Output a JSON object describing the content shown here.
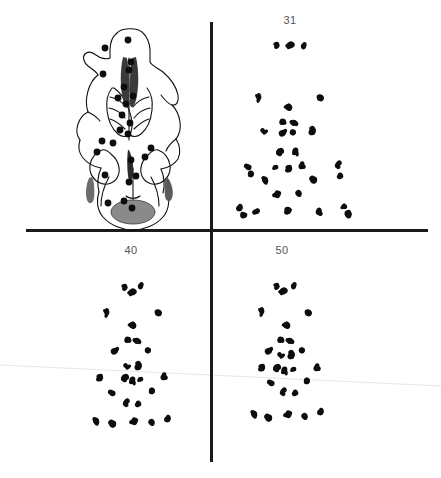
{
  "figure": {
    "title": "",
    "background_color": "#ffffff",
    "width": 441,
    "height": 478,
    "ink_color": "#111111",
    "label_color": "#555555",
    "divider_color": "#1a1a1a",
    "artifact_color": "#e2e2e2"
  },
  "layout": {
    "divider_vertical": {
      "x": 211,
      "y_start": 22,
      "y_end": 462,
      "thickness": 3
    },
    "divider_horizontal": {
      "y": 230,
      "x_start": 26,
      "x_end": 428,
      "thickness": 3
    },
    "artifact_scan_line": {
      "x1": 0,
      "y1": 365,
      "x2": 441,
      "y2": 386
    }
  },
  "panels": [
    {
      "id": "skull-drawing",
      "name": "skull-ventral-view",
      "label": "",
      "label_x": 0,
      "label_y": 0,
      "kind": "line-drawing"
    },
    {
      "id": "panel-31",
      "name": "landmark-scatter-31",
      "label": "31",
      "label_x": 290,
      "label_y": 17,
      "kind": "scatter"
    },
    {
      "id": "panel-40",
      "name": "landmark-scatter-40",
      "label": "40",
      "label_x": 131,
      "label_y": 247,
      "kind": "scatter"
    },
    {
      "id": "panel-50",
      "name": "landmark-scatter-50",
      "label": "50",
      "label_x": 282,
      "label_y": 247,
      "kind": "scatter"
    }
  ],
  "chart_data": {
    "type": "scatter",
    "title": "",
    "subtitle": "",
    "xlabel": "",
    "ylabel": "",
    "grid": false,
    "legend": "none",
    "panels": [
      {
        "name": "skull-ventral-view",
        "label": "",
        "type": "line-drawing-with-landmarks",
        "landmarks": [
          [
            128,
            40
          ],
          [
            105,
            48
          ],
          [
            103,
            74
          ],
          [
            131,
            62
          ],
          [
            124,
            87
          ],
          [
            126,
            104
          ],
          [
            130,
            123
          ],
          [
            118,
            98
          ],
          [
            128,
            134
          ],
          [
            113,
            143
          ],
          [
            102,
            141
          ],
          [
            97,
            152
          ],
          [
            105,
            175
          ],
          [
            131,
            160
          ],
          [
            129,
            182
          ],
          [
            108,
            203
          ],
          [
            124,
            201
          ],
          [
            132,
            208
          ],
          [
            145,
            157
          ],
          [
            151,
            148
          ],
          [
            129,
            70
          ],
          [
            122,
            115
          ],
          [
            133,
            96
          ],
          [
            120,
            130
          ],
          [
            136,
            176
          ]
        ],
        "outline_color": "#111111",
        "fill_features": [
          {
            "name": "foramen-magnum",
            "color": "#808080",
            "cx": 133,
            "cy": 212,
            "rx": 22,
            "ry": 12
          },
          {
            "name": "palatal-fissure-left",
            "color": "#444444"
          },
          {
            "name": "palatal-fissure-right",
            "color": "#444444"
          },
          {
            "name": "bulla-shadow-left",
            "color": "#666666"
          },
          {
            "name": "bulla-shadow-right",
            "color": "#666666"
          }
        ]
      },
      {
        "name": "landmark-scatter-31",
        "label": "31",
        "type": "scatter",
        "n_landmarks": 25,
        "points": [
          [
            276,
            45
          ],
          [
            290,
            45
          ],
          [
            304,
            46
          ],
          [
            259,
            98
          ],
          [
            319,
            97
          ],
          [
            288,
            107
          ],
          [
            283,
            122
          ],
          [
            294,
            122
          ],
          [
            283,
            132
          ],
          [
            294,
            132
          ],
          [
            264,
            131
          ],
          [
            313,
            131
          ],
          [
            280,
            152
          ],
          [
            296,
            152
          ],
          [
            276,
            166
          ],
          [
            289,
            169
          ],
          [
            301,
            166
          ],
          [
            248,
            166
          ],
          [
            251,
            175
          ],
          [
            338,
            165
          ],
          [
            340,
            175
          ],
          [
            265,
            180
          ],
          [
            313,
            180
          ],
          [
            277,
            194
          ],
          [
            299,
            194
          ],
          [
            239,
            208
          ],
          [
            243,
            215
          ],
          [
            257,
            212
          ],
          [
            289,
            211
          ],
          [
            320,
            212
          ],
          [
            344,
            207
          ],
          [
            348,
            214
          ]
        ]
      },
      {
        "name": "landmark-scatter-40",
        "label": "40",
        "type": "scatter",
        "n_landmarks": 25,
        "points": [
          [
            124,
            287
          ],
          [
            132,
            292
          ],
          [
            141,
            286
          ],
          [
            107,
            313
          ],
          [
            157,
            312
          ],
          [
            132,
            325
          ],
          [
            128,
            340
          ],
          [
            137,
            340
          ],
          [
            115,
            350
          ],
          [
            149,
            350
          ],
          [
            127,
            366
          ],
          [
            139,
            366
          ],
          [
            125,
            378
          ],
          [
            133,
            381
          ],
          [
            141,
            378
          ],
          [
            100,
            378
          ],
          [
            163,
            377
          ],
          [
            112,
            392
          ],
          [
            152,
            392
          ],
          [
            126,
            403
          ],
          [
            138,
            403
          ],
          [
            96,
            421
          ],
          [
            112,
            424
          ],
          [
            134,
            421
          ],
          [
            152,
            423
          ],
          [
            167,
            419
          ]
        ]
      },
      {
        "name": "landmark-scatter-50",
        "label": "50",
        "type": "scatter",
        "n_landmarks": 25,
        "points": [
          [
            276,
            286
          ],
          [
            283,
            291
          ],
          [
            294,
            286
          ],
          [
            262,
            312
          ],
          [
            307,
            312
          ],
          [
            286,
            325
          ],
          [
            281,
            340
          ],
          [
            290,
            340
          ],
          [
            269,
            350
          ],
          [
            303,
            350
          ],
          [
            281,
            355
          ],
          [
            292,
            355
          ],
          [
            277,
            368
          ],
          [
            285,
            371
          ],
          [
            294,
            368
          ],
          [
            262,
            368
          ],
          [
            316,
            368
          ],
          [
            271,
            382
          ],
          [
            307,
            382
          ],
          [
            283,
            392
          ],
          [
            295,
            392
          ],
          [
            254,
            414
          ],
          [
            268,
            418
          ],
          [
            288,
            414
          ],
          [
            305,
            417
          ],
          [
            320,
            412
          ]
        ]
      }
    ]
  }
}
